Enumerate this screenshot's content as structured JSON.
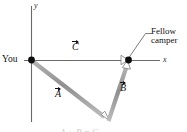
{
  "figure": {
    "type": "vector-diagram",
    "width": 187,
    "height": 132,
    "background": "#ffffff",
    "axes": {
      "x_label": "x",
      "y_label": "y",
      "origin": [
        31,
        60
      ],
      "axis_color": "#5a5a5a"
    },
    "points": [
      {
        "name": "origin-point",
        "label": "You",
        "x": 31,
        "y": 60,
        "marker": "filled-dot",
        "color": "#111111"
      },
      {
        "name": "fellow-camper-point",
        "label": "Fellow camper",
        "x": 128,
        "y": 60,
        "marker": "filled-dot",
        "color": "#111111"
      },
      {
        "name": "corner-point",
        "label": "",
        "x": 108,
        "y": 120,
        "marker": "open-arrowhead",
        "color": "#9a9a9a"
      }
    ],
    "labels": {
      "you": "You",
      "camper_line1": "Fellow",
      "camper_line2": "camper",
      "x_axis": "x",
      "y_axis": "y",
      "vector_a": "A",
      "vector_b": "B",
      "vector_c": "C"
    },
    "vectors": [
      {
        "name": "vector-c",
        "label": "C",
        "from": [
          31,
          60
        ],
        "to": [
          128,
          60
        ],
        "color": "#9a9a9a",
        "arrowhead": "open",
        "label_pos": [
          74,
          41
        ]
      },
      {
        "name": "vector-a",
        "label": "A",
        "from": [
          31,
          60
        ],
        "to": [
          108,
          120
        ],
        "color": "#9a9a9a",
        "arrowhead": "open",
        "label_pos": [
          57,
          90
        ]
      },
      {
        "name": "vector-b",
        "label": "B",
        "from": [
          108,
          120
        ],
        "to": [
          128,
          61
        ],
        "color": "#9a9a9a",
        "arrowhead": "open",
        "label_pos": [
          121,
          83
        ]
      }
    ],
    "leader_line": {
      "name": "camper-leader-line",
      "from": [
        128,
        58
      ],
      "to": [
        147,
        32
      ],
      "color": "#6e6e6e"
    },
    "cut_caption": "A + B = C"
  }
}
